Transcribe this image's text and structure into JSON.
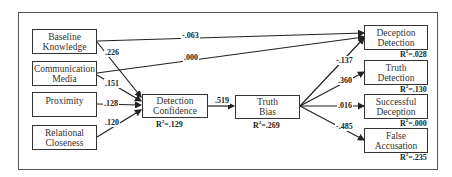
{
  "nodes": {
    "baseline_knowledge": {
      "line1": "Baseline",
      "line2": "Knowledge"
    },
    "communication_media": {
      "line1": "Communication",
      "line2": "Media"
    },
    "proximity": {
      "line1": "Proximity"
    },
    "relational_closeness": {
      "line1": "Relational",
      "line2": "Closeness"
    },
    "detection_confidence": {
      "line1": "Detection",
      "line2": "Confidence",
      "r2_label": "R",
      "r2_value": "=.129"
    },
    "truth_bias": {
      "line1": "Truth",
      "line2": "Bias",
      "r2_label": "R",
      "r2_value": "=.269"
    },
    "deception_detection": {
      "line1": "Deception",
      "line2": "Detection",
      "r2_label": "R",
      "r2_value": "=.028"
    },
    "truth_detection": {
      "line1": "Truth",
      "line2": "Detection",
      "r2_label": "R",
      "r2_value": "=.130"
    },
    "successful_deception": {
      "line1": "Successful",
      "line2": "Deception",
      "r2_label": "R",
      "r2_value": "=.000"
    },
    "false_accusation": {
      "line1": "False",
      "line2": "Accusation",
      "r2_label": "R",
      "r2_value": "=.235"
    }
  },
  "r2_superscript": "2",
  "paths": [
    {
      "from": "Baseline Knowledge",
      "to": "Deception Detection",
      "coef": "-.063"
    },
    {
      "from": "Communication Media",
      "to": "Deception Detection",
      "coef": ".000"
    },
    {
      "from": "Baseline Knowledge",
      "to": "Detection Confidence",
      "coef": ".226"
    },
    {
      "from": "Communication Media",
      "to": "Detection Confidence",
      "coef": ".151"
    },
    {
      "from": "Proximity",
      "to": "Detection Confidence",
      "coef": ".128"
    },
    {
      "from": "Relational Closeness",
      "to": "Detection Confidence",
      "coef": ".120"
    },
    {
      "from": "Detection Confidence",
      "to": "Truth Bias",
      "coef": ".519"
    },
    {
      "from": "Truth Bias",
      "to": "Deception Detection",
      "coef": "-.137"
    },
    {
      "from": "Truth Bias",
      "to": "Truth Detection",
      "coef": ".360"
    },
    {
      "from": "Truth Bias",
      "to": "Successful Deception",
      "coef": ".016"
    },
    {
      "from": "Truth Bias",
      "to": "False Accusation",
      "coef": "-.485"
    }
  ]
}
